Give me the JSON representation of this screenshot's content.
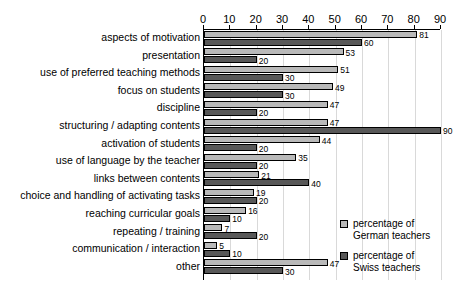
{
  "chart_data": {
    "type": "bar",
    "orientation": "horizontal",
    "title": "",
    "xlabel": "",
    "ylabel": "",
    "xlim": [
      0,
      90
    ],
    "xticks": [
      0,
      10,
      20,
      30,
      40,
      50,
      60,
      70,
      80,
      90
    ],
    "grid": true,
    "legend_position": "bottom-right",
    "categories": [
      "aspects of motivation",
      "presentation",
      "use of preferred teaching methods",
      "focus on students",
      "discipline",
      "structuring / adapting contents",
      "activation of students",
      "use of language by the teacher",
      "links between contents",
      "choice and handling of activating tasks",
      "reaching curricular goals",
      "repeating / training",
      "communication / interaction",
      "other"
    ],
    "series": [
      {
        "name": "percentage of German teachers",
        "name_line1": "percentage of",
        "name_line2": "German teachers",
        "color": "#b9b9b9",
        "values": [
          81,
          53,
          51,
          49,
          47,
          47,
          44,
          35,
          21,
          19,
          16,
          7,
          5,
          47
        ]
      },
      {
        "name": "percentage of Swiss teachers",
        "name_line1": "percentage of",
        "name_line2": "Swiss teachers",
        "color": "#585858",
        "values": [
          60,
          20,
          30,
          30,
          20,
          90,
          20,
          20,
          40,
          20,
          10,
          20,
          10,
          30
        ]
      }
    ]
  }
}
